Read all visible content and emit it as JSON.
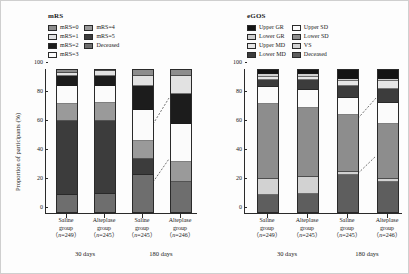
{
  "figure": {
    "ylabel": "Proportion of participants (%)",
    "yticks": [
      "0",
      "20",
      "40",
      "60",
      "80",
      "100"
    ]
  },
  "panels": [
    {
      "key": "mrs",
      "title": "mRS",
      "legend": [
        {
          "label": "mRS=0",
          "color": "#8d8d8d"
        },
        {
          "label": "mRS=4",
          "color": "#9a9a9a"
        },
        {
          "label": "mRS=1",
          "color": "#e2e2e2"
        },
        {
          "label": "mRS=5",
          "color": "#3c3c3c"
        },
        {
          "label": "mRS=2",
          "color": "#1c1c1c"
        },
        {
          "label": "Deceased",
          "color": "#6e6e6e"
        },
        {
          "label": "mRS=3",
          "color": "#fbfbfb"
        }
      ],
      "groups": [
        {
          "drug": "Saline",
          "group": "group",
          "n": "n=249",
          "time": "30 days"
        },
        {
          "drug": "Alteplase",
          "group": "group",
          "n": "n=245",
          "time": "30 days"
        },
        {
          "drug": "Saline",
          "group": "group",
          "n": "n=245",
          "time": "180 days"
        },
        {
          "drug": "Alteplase",
          "group": "group",
          "n": "n=246",
          "time": "180 days"
        }
      ]
    },
    {
      "key": "egos",
      "title": "eGOS",
      "legend": [
        {
          "label": "Upper GR",
          "color": "#141414"
        },
        {
          "label": "Upper SD",
          "color": "#fbfbfb"
        },
        {
          "label": "Lower GR",
          "color": "#cfcfcf"
        },
        {
          "label": "Lower SD",
          "color": "#8d8d8d"
        },
        {
          "label": "Upper MD",
          "color": "#e6e6e6"
        },
        {
          "label": "VS",
          "color": "#d2d2d2"
        },
        {
          "label": "Lower MD",
          "color": "#3c3c3c"
        },
        {
          "label": "Deceased",
          "color": "#5e5e5e"
        }
      ],
      "groups": [
        {
          "drug": "Saline",
          "group": "group",
          "n": "n=249",
          "time": "30 days"
        },
        {
          "drug": "Alteplase",
          "group": "group",
          "n": "n=245",
          "time": "30 days"
        },
        {
          "drug": "Saline",
          "group": "group",
          "n": "n=245",
          "time": "180 days"
        },
        {
          "drug": "Alteplase",
          "group": "group",
          "n": "n=246",
          "time": "180 days"
        }
      ]
    }
  ],
  "chart_data": [
    {
      "type": "bar",
      "title": "mRS",
      "stacked": true,
      "xlabel": "",
      "ylabel": "Proportion of participants (%)",
      "ylim": [
        0,
        100
      ],
      "grid": false,
      "legend_position": "top-left",
      "categories": [
        "Saline group (n=249) 30 days",
        "Alteplase group (n=245) 30 days",
        "Saline group (n=245) 180 days",
        "Alteplase group (n=246) 180 days"
      ],
      "series": [
        {
          "name": "Deceased",
          "color": "#6e6e6e",
          "values": [
            12,
            13,
            26,
            21
          ]
        },
        {
          "name": "mRS=5",
          "color": "#3c3c3c",
          "values": [
            52,
            51,
            11,
            0
          ]
        },
        {
          "name": "mRS=4",
          "color": "#9a9a9a",
          "values": [
            12,
            13,
            13,
            14
          ]
        },
        {
          "name": "mRS=3",
          "color": "#fbfbfb",
          "values": [
            13,
            12,
            22,
            27
          ]
        },
        {
          "name": "mRS=2",
          "color": "#1c1c1c",
          "values": [
            7,
            7,
            17,
            21
          ]
        },
        {
          "name": "mRS=1",
          "color": "#e2e2e2",
          "values": [
            2,
            3,
            7,
            13
          ]
        },
        {
          "name": "mRS=0",
          "color": "#8d8d8d",
          "values": [
            2,
            1,
            4,
            4
          ]
        }
      ]
    },
    {
      "type": "bar",
      "title": "eGOS",
      "stacked": true,
      "xlabel": "",
      "ylabel": "Proportion of participants (%)",
      "ylim": [
        0,
        100
      ],
      "grid": false,
      "legend_position": "top-left",
      "categories": [
        "Saline group (n=249) 30 days",
        "Alteplase group (n=245) 30 days",
        "Saline group (n=245) 180 days",
        "Alteplase group (n=246) 180 days"
      ],
      "series": [
        {
          "name": "Deceased",
          "color": "#5e5e5e",
          "values": [
            12,
            13,
            26,
            21
          ]
        },
        {
          "name": "VS",
          "color": "#d2d2d2",
          "values": [
            11,
            12,
            2,
            2
          ]
        },
        {
          "name": "Lower SD",
          "color": "#8d8d8d",
          "values": [
            53,
            48,
            40,
            39
          ]
        },
        {
          "name": "Upper SD",
          "color": "#fbfbfb",
          "values": [
            12,
            13,
            12,
            15
          ]
        },
        {
          "name": "Lower MD",
          "color": "#3c3c3c",
          "values": [
            5,
            7,
            9,
            10
          ]
        },
        {
          "name": "Upper MD",
          "color": "#e6e6e6",
          "values": [
            2,
            2,
            3,
            5
          ]
        },
        {
          "name": "Lower GR",
          "color": "#cfcfcf",
          "values": [
            2,
            2,
            2,
            2
          ]
        },
        {
          "name": "Upper GR",
          "color": "#141414",
          "values": [
            3,
            3,
            6,
            6
          ]
        }
      ]
    }
  ]
}
